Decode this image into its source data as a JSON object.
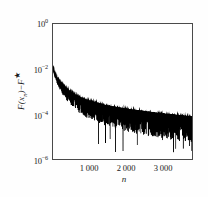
{
  "figure": {
    "background_color": "#fefefe",
    "plot_background_color": "#ffffff",
    "axis_color": "#4a4a4a",
    "data_color": "#000000"
  },
  "axis_titles": {
    "x": "n",
    "y_prefix": "F",
    "y_open": "(",
    "y_var": "x",
    "y_sub": "n",
    "y_close": ")",
    "y_minus": "−",
    "y_fstar": "F",
    "y_star": "★"
  },
  "ticks": {
    "y": [
      {
        "label_base": "10",
        "label_exp": "0",
        "value": 1
      },
      {
        "label_base": "10",
        "label_exp": "−2",
        "value": 0.01
      },
      {
        "label_base": "10",
        "label_exp": "−4",
        "value": 0.0001
      },
      {
        "label_base": "10",
        "label_exp": "−6",
        "value": 1e-06
      }
    ],
    "x": [
      {
        "label": "1 000",
        "value": 1000
      },
      {
        "label": "2 000",
        "value": 2000
      },
      {
        "label": "3 000",
        "value": 3000
      }
    ]
  },
  "chart_data": {
    "type": "line",
    "title": "",
    "subtitle": "",
    "xlabel": "n",
    "ylabel": "F(x_n) - F*",
    "yscale": "log",
    "xscale": "linear",
    "xlim": [
      0,
      3750
    ],
    "ylim": [
      1e-06,
      1
    ],
    "grid": false,
    "legend": null,
    "xticks": [
      1000,
      2000,
      3000
    ],
    "xticklabels": [
      "1 000",
      "2 000",
      "3 000"
    ],
    "yticks": [
      1,
      0.01,
      0.0001,
      1e-06
    ],
    "yticklabels": [
      "10^0",
      "10^-2",
      "10^-4",
      "10^-6"
    ],
    "series": [
      {
        "name": "F(x_n) - F*",
        "color": "#000000",
        "envelope_upper": {
          "x": [
            5,
            40,
            80,
            120,
            180,
            250,
            350,
            500,
            700,
            900,
            1100,
            1400,
            1700,
            2000,
            2300,
            2600,
            2900,
            3200,
            3500,
            3750
          ],
          "y": [
            0.011,
            0.0072,
            0.005,
            0.0038,
            0.0028,
            0.0021,
            0.00145,
            0.00095,
            0.00062,
            0.00045,
            0.00036,
            0.00026,
            0.00021,
            0.000175,
            0.000148,
            0.000128,
            0.000112,
            0.0001,
            8.8e-05,
            8e-05
          ]
        },
        "envelope_lower": {
          "x": [
            5,
            40,
            80,
            120,
            180,
            250,
            350,
            500,
            700,
            900,
            1100,
            1400,
            1700,
            2000,
            2300,
            2600,
            2900,
            3200,
            3500,
            3750
          ],
          "y": [
            0.0095,
            0.0048,
            0.0029,
            0.0019,
            0.0012,
            0.00078,
            0.00044,
            0.00023,
            0.000115,
            7e-05,
            5e-05,
            3.1e-05,
            2.2e-05,
            1.65e-05,
            1.28e-05,
            1.02e-05,
            8.4e-06,
            6.9e-06,
            5.8e-06,
            5e-06
          ]
        },
        "spike_minimum": 1.9e-06,
        "start_value": 0.011,
        "end_value": 8e-05
      }
    ]
  }
}
